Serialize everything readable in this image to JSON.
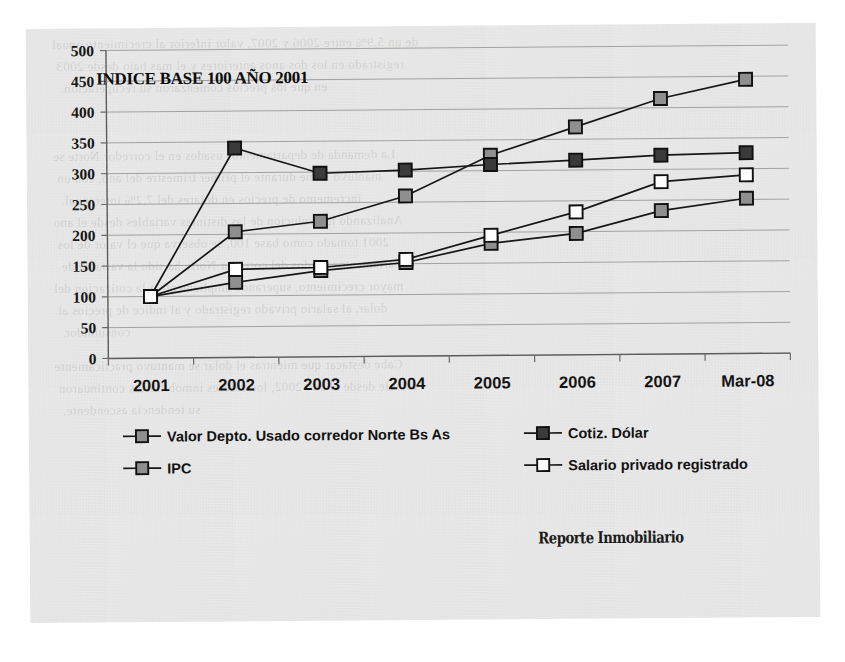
{
  "page": {
    "background_color": "#ffffff",
    "paper_color": "#e9e9e9",
    "ghost_text": [
      "de un 5,9% entre 2006 y 2007, valor inferior al crecimiento anual",
      "registrado en los dos anos anteriores y el mas bajo desde 2003",
      "en que los precios comenzaron su recuperacion.",
      "La demanda de departamentos usados en el corredor Norte se",
      "mantuvo firme durante el primer trimestre del ano, con un",
      "incremento de precios en dolares del 7,2% interanual.",
      "Analizando la evolucion de las distintas variables desde el ano",
      "2001 tomado como base 100, se observa que el valor de los",
      "departamentos usados del corredor Norte ha sido la variable de",
      "mayor crecimiento, superando ampliamente a la cotizacion del",
      "dolar, al salario privado registrado y al indice de precios al",
      "consumidor.",
      "Cabe destacar que mientras el dolar se mantuvo practicamente",
      "estable desde el ano 2002, los valores inmobiliarios continuaron",
      "su tendencia ascendente."
    ]
  },
  "chart_data": {
    "type": "line",
    "title": "INDICE BASE 100 AÑO 2001",
    "xlabel": "",
    "ylabel": "",
    "categories": [
      "2001",
      "2002",
      "2003",
      "2004",
      "2005",
      "2006",
      "2007",
      "Mar-08"
    ],
    "ylim": [
      0,
      500
    ],
    "yticks": [
      0,
      50,
      100,
      150,
      200,
      250,
      300,
      350,
      400,
      450,
      500
    ],
    "grid": true,
    "legend_position": "bottom",
    "series": [
      {
        "name": "Valor Depto. Usado corredor Norte Bs As",
        "marker": "square-gray",
        "marker_fill": "#8f8f8f",
        "values": [
          100,
          204,
          220,
          260,
          325,
          370,
          415,
          445
        ]
      },
      {
        "name": "Cotiz. Dólar",
        "marker": "square-dark",
        "marker_fill": "#3a3a3a",
        "values": [
          100,
          340,
          298,
          302,
          310,
          316,
          323,
          326
        ]
      },
      {
        "name": "IPC",
        "marker": "square-gray",
        "marker_fill": "#8f8f8f",
        "values": [
          100,
          122,
          140,
          152,
          182,
          197,
          233,
          252
        ]
      },
      {
        "name": "Salario privado registrado",
        "marker": "square-white",
        "marker_fill": "#ffffff",
        "values": [
          100,
          143,
          145,
          157,
          195,
          232,
          280,
          290
        ]
      }
    ]
  },
  "legend": {
    "entries": [
      {
        "label": "Valor Depto. Usado corredor Norte Bs As",
        "fill": "#8f8f8f"
      },
      {
        "label": "Cotiz. Dólar",
        "fill": "#3a3a3a"
      },
      {
        "label": "IPC",
        "fill": "#8f8f8f"
      },
      {
        "label": "Salario privado registrado",
        "fill": "#ffffff"
      }
    ]
  },
  "watermark": {
    "text": "Reporte Inmobiliario"
  }
}
